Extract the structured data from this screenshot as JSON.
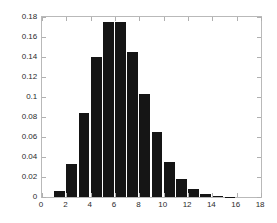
{
  "chart_data": {
    "type": "bar",
    "title": "",
    "subtitle": "",
    "xlabel": "",
    "ylabel": "",
    "xlim": [
      0,
      18
    ],
    "ylim": [
      0,
      0.18
    ],
    "grid": false,
    "legend": null,
    "bar_color": "#151515",
    "axis_color": "#b9b9b9",
    "background": "#ffffff",
    "bin_width": 1,
    "bin_starts": [
      1,
      2,
      3,
      4,
      5,
      6,
      7,
      8,
      9,
      10,
      11,
      12,
      13,
      14,
      15
    ],
    "categories": [
      "1",
      "2",
      "3",
      "4",
      "5",
      "6",
      "7",
      "8",
      "9",
      "10",
      "11",
      "12",
      "13",
      "14",
      "15"
    ],
    "values": [
      0.0065,
      0.0335,
      0.084,
      0.14,
      0.175,
      0.175,
      0.1455,
      0.1035,
      0.065,
      0.0355,
      0.018,
      0.008,
      0.003,
      0.001,
      0.0005
    ],
    "xticks": [
      0,
      2,
      4,
      6,
      8,
      10,
      12,
      14,
      16,
      18
    ],
    "xticklabels": [
      "0",
      "2",
      "4",
      "6",
      "8",
      "10",
      "12",
      "14",
      "16",
      "18"
    ],
    "yticks": [
      0,
      0.02,
      0.04,
      0.06,
      0.08,
      0.1,
      0.12,
      0.14,
      0.16,
      0.18
    ],
    "yticklabels": [
      "0",
      "0.02",
      "0.04",
      "0.06",
      "0.08",
      "0.1",
      "0.12",
      "0.14",
      "0.16",
      "0.18"
    ]
  }
}
